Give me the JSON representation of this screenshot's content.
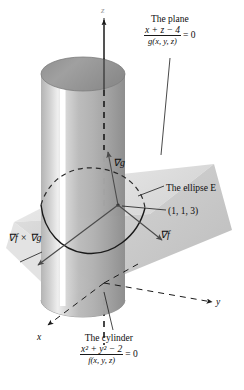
{
  "figure": {
    "background": "#ffffff"
  },
  "colors": {
    "ink": "#0d0d0d",
    "cylinder_light": "#e8e8e8",
    "cylinder_mid": "#a8a8a8",
    "cylinder_dark": "#8a8a8a",
    "cylinder_top": "#9a9a9a",
    "plane_fill": "#c6c6c6",
    "plane_fill_light": "#dcdcdc",
    "highlight": "#ffffff",
    "axis": "#1a1a1a",
    "caption": "#c9c9c9"
  },
  "labels": {
    "plane": {
      "title": "The plane",
      "equation_numerator": "x + z − 4",
      "equation_rhs": "= 0",
      "equation_denominator": "g(x, y, z)"
    },
    "cylinder": {
      "title": "The cylinder",
      "equation_numerator": "x² + y² − 2",
      "equation_rhs": "= 0",
      "equation_denominator": "f(x, y, z)"
    },
    "ellipse": "The ellipse E",
    "point": "(1, 1, 3)",
    "grad_g": "∇g",
    "grad_f": "∇f",
    "grad_cross": "∇f × ∇g",
    "axis_x": "x",
    "axis_y": "y",
    "axis_z": "z"
  },
  "caption": {
    "text": ""
  },
  "geometry": {
    "point_of_tangency": {
      "x": 1,
      "y": 1,
      "z": 3
    },
    "cylinder_radius_squared": 2,
    "plane_constant": 4
  }
}
